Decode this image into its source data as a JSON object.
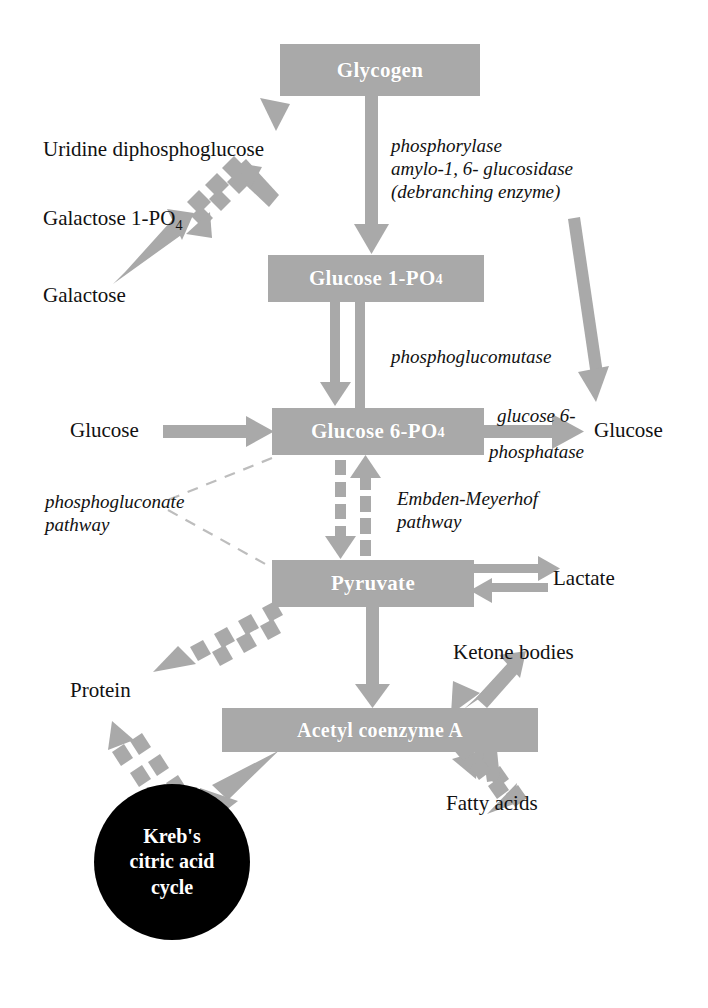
{
  "diagram": {
    "colors": {
      "node_fill": "#a9a9a9",
      "arrow": "#a9a9a9",
      "krebs_fill": "#000000",
      "text_dark": "#111111",
      "text_light": "#ffffff",
      "background": "#ffffff"
    },
    "nodes": [
      {
        "id": "glycogen",
        "label": "Glycogen",
        "sub": "",
        "x": 280,
        "y": 44,
        "w": 200,
        "h": 52,
        "font_size": 21
      },
      {
        "id": "glucose1po4",
        "label": "Glucose 1-PO",
        "sub": "4",
        "x": 268,
        "y": 255,
        "w": 216,
        "h": 47,
        "font_size": 21
      },
      {
        "id": "glucose6po4",
        "label": "Glucose 6-PO",
        "sub": "4",
        "x": 272,
        "y": 408,
        "w": 212,
        "h": 47,
        "font_size": 21
      },
      {
        "id": "pyruvate",
        "label": "Pyruvate",
        "sub": "",
        "x": 272,
        "y": 560,
        "w": 202,
        "h": 47,
        "font_size": 21
      },
      {
        "id": "acetylcoa",
        "label": "Acetyl coenzyme A",
        "sub": "",
        "x": 222,
        "y": 708,
        "w": 316,
        "h": 44,
        "font_size": 20
      }
    ],
    "krebs": {
      "id": "krebs-cycle",
      "lines": [
        "Kreb's",
        "citric acid",
        "cycle"
      ],
      "cx": 172,
      "cy": 862,
      "r": 78,
      "font_size": 20
    },
    "plain_labels": [
      {
        "id": "uridine-diphosphoglucose",
        "text": "Uridine diphosphoglucose",
        "sub": "",
        "x": 43,
        "y": 137,
        "font_size": 21,
        "align": "left"
      },
      {
        "id": "galactose-1-po4",
        "text": "Galactose 1-PO",
        "sub": "4",
        "x": 43,
        "y": 206,
        "font_size": 21,
        "align": "left"
      },
      {
        "id": "galactose",
        "text": "Galactose",
        "sub": "",
        "x": 43,
        "y": 283,
        "font_size": 21,
        "align": "left"
      },
      {
        "id": "glucose-left",
        "text": "Glucose",
        "sub": "",
        "x": 70,
        "y": 418,
        "font_size": 21,
        "align": "left"
      },
      {
        "id": "glucose-right",
        "text": "Glucose",
        "sub": "",
        "x": 594,
        "y": 418,
        "font_size": 21,
        "align": "left"
      },
      {
        "id": "lactate",
        "text": "Lactate",
        "sub": "",
        "x": 553,
        "y": 566,
        "font_size": 21,
        "align": "left"
      },
      {
        "id": "protein",
        "text": "Protein",
        "sub": "",
        "x": 70,
        "y": 678,
        "font_size": 21,
        "align": "left"
      },
      {
        "id": "ketone-bodies",
        "text": "Ketone bodies",
        "sub": "",
        "x": 453,
        "y": 640,
        "font_size": 21,
        "align": "left"
      },
      {
        "id": "fatty-acids",
        "text": "Fatty acids",
        "sub": "",
        "x": 446,
        "y": 791,
        "font_size": 21,
        "align": "left"
      }
    ],
    "enzyme_labels": [
      {
        "id": "phosphorylase-group",
        "text": "phosphorylase\namylo-1, 6- glucosidase\n(debranching enzyme)",
        "x": 391,
        "y": 134,
        "font_size": 19
      },
      {
        "id": "phosphoglucomutase",
        "text": "phosphoglucomutase",
        "x": 391,
        "y": 345,
        "font_size": 19
      },
      {
        "id": "glucose-6-phosphatase",
        "text": "glucose 6-",
        "x": 497,
        "y": 404,
        "font_size": 19
      },
      {
        "id": "glucose-6-phosphatase-line2",
        "text": "phosphatase",
        "x": 489,
        "y": 440,
        "font_size": 19
      },
      {
        "id": "phosphogluconate-pathway",
        "text": "phosphogluconate\npathway",
        "x": 45,
        "y": 490,
        "font_size": 19
      },
      {
        "id": "embden-meyerhof-pathway",
        "text": "Embden-Meyerhof\npathway",
        "x": 397,
        "y": 487,
        "font_size": 19
      }
    ],
    "connections": [
      {
        "id": "glycogen-to-glucose1po4",
        "style": "solid",
        "direction": "down",
        "from": "glycogen",
        "to": "glucose1po4"
      },
      {
        "id": "udpg-to-glycogen",
        "style": "solid",
        "direction": "up-right",
        "from": "uridine-diphosphoglucose",
        "to": "glycogen"
      },
      {
        "id": "galactose1po4-to-udpg",
        "style": "dashed",
        "direction": "bidirectional",
        "from": "galactose-1-po4",
        "to": "uridine-diphosphoglucose"
      },
      {
        "id": "galactose-to-galactose1po4",
        "style": "solid",
        "direction": "up-right",
        "from": "galactose",
        "to": "galactose-1-po4"
      },
      {
        "id": "glycogen-to-glucose-right",
        "style": "solid",
        "direction": "down",
        "from": "glycogen",
        "to": "glucose-right"
      },
      {
        "id": "glucose1po4-glucose6po4",
        "style": "solid",
        "direction": "bidirectional",
        "from": "glucose1po4",
        "to": "glucose6po4"
      },
      {
        "id": "glucose-left-to-glucose6po4",
        "style": "solid",
        "direction": "right",
        "from": "glucose-left",
        "to": "glucose6po4"
      },
      {
        "id": "glucose6po4-to-glucose-right",
        "style": "solid",
        "direction": "right",
        "from": "glucose6po4",
        "to": "glucose-right"
      },
      {
        "id": "glucose6po4-pyruvate",
        "style": "dashed",
        "direction": "bidirectional",
        "from": "glucose6po4",
        "to": "pyruvate"
      },
      {
        "id": "phosphogluconate-link",
        "style": "thin-dashed",
        "direction": "none",
        "from": "glucose6po4",
        "to": "pyruvate"
      },
      {
        "id": "pyruvate-lactate",
        "style": "solid",
        "direction": "bidirectional",
        "from": "pyruvate",
        "to": "lactate"
      },
      {
        "id": "pyruvate-to-acetylcoa",
        "style": "solid",
        "direction": "down",
        "from": "pyruvate",
        "to": "acetylcoa"
      },
      {
        "id": "pyruvate-to-protein",
        "style": "dashed",
        "direction": "down-left",
        "from": "pyruvate",
        "to": "protein"
      },
      {
        "id": "protein-acetylcoa",
        "style": "dashed",
        "direction": "bidirectional",
        "from": "protein",
        "to": "acetylcoa"
      },
      {
        "id": "acetylcoa-to-krebs",
        "style": "solid",
        "direction": "down-left",
        "from": "acetylcoa",
        "to": "krebs-cycle"
      },
      {
        "id": "acetylcoa-ketone-bodies",
        "style": "solid",
        "direction": "bidirectional",
        "from": "acetylcoa",
        "to": "ketone-bodies"
      },
      {
        "id": "acetylcoa-fatty-acids",
        "style": "dashed",
        "direction": "bidirectional",
        "from": "acetylcoa",
        "to": "fatty-acids"
      }
    ]
  }
}
